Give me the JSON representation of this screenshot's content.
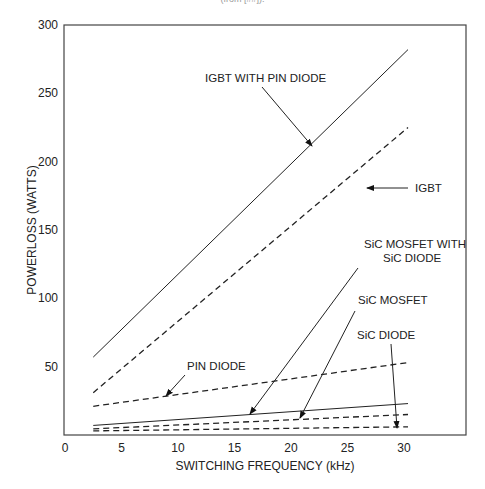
{
  "caption": "(from [##]).",
  "chart_data": {
    "type": "line",
    "title": "",
    "xlabel": "SWITCHING FREQUENCY (kHz)",
    "ylabel": "POWERLOSS (WATTS)",
    "xlim": [
      0,
      35
    ],
    "ylim": [
      0,
      300
    ],
    "x_ticks": [
      0,
      5,
      10,
      15,
      20,
      25,
      30
    ],
    "x_tick_labels": [
      "0",
      "5",
      "10",
      "15",
      "20",
      "25",
      "30"
    ],
    "y_ticks": [
      50,
      100,
      150,
      200,
      250,
      300
    ],
    "y_tick_labels": [
      "50",
      "100",
      "150",
      "200",
      "250",
      "300"
    ],
    "grid": false,
    "legend": "inline annotations with arrows",
    "x": [
      2.5,
      30
    ],
    "series": [
      {
        "name": "IGBT WITH PIN DIODE",
        "style": "solid",
        "values": [
          57,
          282
        ]
      },
      {
        "name": "IGBT",
        "style": "dashed",
        "values": [
          31,
          225
        ]
      },
      {
        "name": "PIN DIODE",
        "style": "dashed",
        "values": [
          21,
          53
        ]
      },
      {
        "name": "SiC MOSFET WITH SiC DIODE",
        "style": "solid",
        "values": [
          7,
          23
        ]
      },
      {
        "name": "SiC MOSFET",
        "style": "dashed",
        "values": [
          4.5,
          15
        ]
      },
      {
        "name": "SiC DIODE",
        "style": "dashed",
        "values": [
          3,
          6
        ]
      }
    ],
    "annotations": [
      {
        "text": "IGBT WITH PIN DIODE"
      },
      {
        "text": "IGBT"
      },
      {
        "text": "SiC MOSFET WITH"
      },
      {
        "text": "SiC DIODE"
      },
      {
        "text": "SiC MOSFET"
      },
      {
        "text": "SiC DIODE"
      },
      {
        "text": "PIN DIODE"
      }
    ]
  }
}
